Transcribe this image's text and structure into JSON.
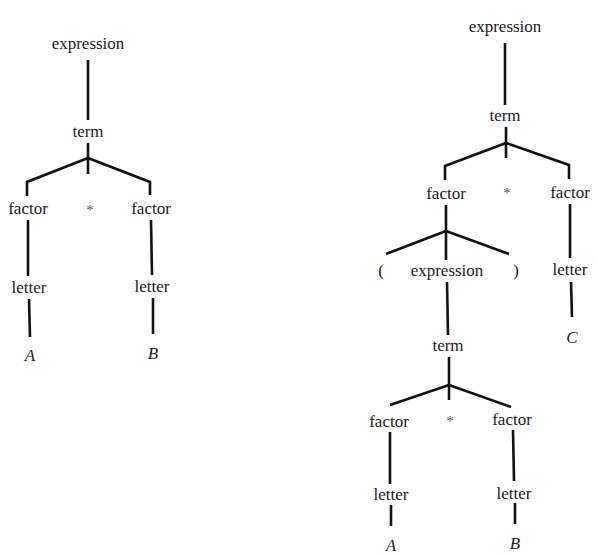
{
  "diagram": {
    "type": "parse-trees",
    "trees": [
      {
        "id": "tree-left",
        "expression": "A * B",
        "nodes": {
          "root": "expression",
          "term": "term",
          "factor_left": "factor",
          "operator": "*",
          "factor_right": "factor",
          "letter_left": "letter",
          "letter_right": "letter",
          "leaf_left": "A",
          "leaf_right": "B"
        }
      },
      {
        "id": "tree-right",
        "expression": "(A * B) * C",
        "nodes": {
          "root": "expression",
          "term": "term",
          "factor_left": "factor",
          "operator": "*",
          "factor_right": "factor",
          "open_paren": "(",
          "inner_expression": "expression",
          "close_paren": ")",
          "letter_right": "letter",
          "leaf_right": "C",
          "inner_term": "term",
          "inner_factor_left": "factor",
          "inner_operator": "*",
          "inner_factor_right": "factor",
          "inner_letter_left": "letter",
          "inner_letter_right": "letter",
          "inner_leaf_left": "A",
          "inner_leaf_right": "B"
        }
      }
    ]
  }
}
